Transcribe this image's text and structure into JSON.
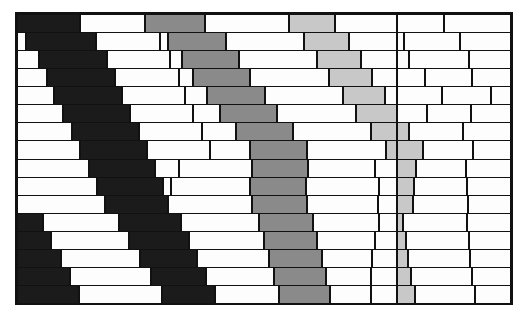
{
  "figure": {
    "name": "masonry-wall-diagram",
    "background_color": "#ffffff",
    "outline_color": "#111111"
  },
  "geometry": {
    "origin_x": 17,
    "origin_y": 14,
    "wall_width": 494,
    "wall_height": 289,
    "row_count": 16,
    "row_height": 18.0625,
    "mortar_line_width": 1.5,
    "outer_border_width": 2
  },
  "palette": {
    "white": "#fdfdfd",
    "black": "#1b1b1b",
    "dark_gray": "#8a8a8a",
    "light_gray": "#c8c8c8",
    "mortar": "#111111"
  },
  "legend": {
    "band_1_label": "black band",
    "band_1_color": "#1b1b1b",
    "band_2_label": "dark gray band",
    "band_2_color": "#8a8a8a",
    "band_3_label": "light gray band",
    "band_3_color": "#c8c8c8",
    "field_label": "plain brick",
    "field_color": "#fdfdfd"
  },
  "chart_data": {
    "type": "table",
    "xlabel": "",
    "ylabel": "",
    "rows": [
      {
        "index": 1,
        "bricks": [
          {
            "x": 0,
            "w": 63,
            "color": "black"
          },
          {
            "x": 63,
            "w": 65,
            "color": "white"
          },
          {
            "x": 128,
            "w": 60,
            "color": "dark"
          },
          {
            "x": 188,
            "w": 84,
            "color": "white"
          },
          {
            "x": 272,
            "w": 46,
            "color": "light"
          },
          {
            "x": 318,
            "w": 62,
            "color": "white"
          },
          {
            "x": 380,
            "w": 47,
            "color": "white"
          },
          {
            "x": 427,
            "w": 67,
            "color": "white"
          }
        ]
      },
      {
        "index": 2,
        "bricks": [
          {
            "x": 0,
            "w": 9,
            "color": "white"
          },
          {
            "x": 9,
            "w": 70,
            "color": "black"
          },
          {
            "x": 79,
            "w": 64,
            "color": "white"
          },
          {
            "x": 143,
            "w": 8,
            "color": "white"
          },
          {
            "x": 151,
            "w": 58,
            "color": "dark"
          },
          {
            "x": 209,
            "w": 78,
            "color": "white"
          },
          {
            "x": 287,
            "w": 45,
            "color": "light"
          },
          {
            "x": 332,
            "w": 48,
            "color": "white"
          },
          {
            "x": 380,
            "w": 7,
            "color": "white"
          },
          {
            "x": 387,
            "w": 56,
            "color": "white"
          },
          {
            "x": 443,
            "w": 51,
            "color": "white"
          }
        ]
      },
      {
        "index": 3,
        "bricks": [
          {
            "x": 0,
            "w": 22,
            "color": "white"
          },
          {
            "x": 22,
            "w": 68,
            "color": "black"
          },
          {
            "x": 90,
            "w": 63,
            "color": "white"
          },
          {
            "x": 153,
            "w": 12,
            "color": "white"
          },
          {
            "x": 165,
            "w": 57,
            "color": "dark"
          },
          {
            "x": 222,
            "w": 78,
            "color": "white"
          },
          {
            "x": 300,
            "w": 44,
            "color": "light"
          },
          {
            "x": 344,
            "w": 36,
            "color": "white"
          },
          {
            "x": 380,
            "w": 12,
            "color": "white"
          },
          {
            "x": 392,
            "w": 60,
            "color": "white"
          },
          {
            "x": 452,
            "w": 42,
            "color": "white"
          }
        ]
      },
      {
        "index": 4,
        "bricks": [
          {
            "x": 0,
            "w": 30,
            "color": "white"
          },
          {
            "x": 30,
            "w": 68,
            "color": "black"
          },
          {
            "x": 98,
            "w": 64,
            "color": "white"
          },
          {
            "x": 162,
            "w": 14,
            "color": "white"
          },
          {
            "x": 176,
            "w": 57,
            "color": "dark"
          },
          {
            "x": 233,
            "w": 79,
            "color": "white"
          },
          {
            "x": 312,
            "w": 43,
            "color": "light"
          },
          {
            "x": 355,
            "w": 25,
            "color": "white"
          },
          {
            "x": 380,
            "w": 28,
            "color": "white"
          },
          {
            "x": 408,
            "w": 47,
            "color": "white"
          },
          {
            "x": 455,
            "w": 39,
            "color": "white"
          }
        ]
      },
      {
        "index": 5,
        "bricks": [
          {
            "x": 0,
            "w": 37,
            "color": "white"
          },
          {
            "x": 37,
            "w": 68,
            "color": "black"
          },
          {
            "x": 105,
            "w": 63,
            "color": "white"
          },
          {
            "x": 168,
            "w": 22,
            "color": "white"
          },
          {
            "x": 190,
            "w": 58,
            "color": "dark"
          },
          {
            "x": 248,
            "w": 78,
            "color": "white"
          },
          {
            "x": 326,
            "w": 42,
            "color": "light"
          },
          {
            "x": 368,
            "w": 12,
            "color": "white"
          },
          {
            "x": 380,
            "w": 45,
            "color": "white"
          },
          {
            "x": 425,
            "w": 49,
            "color": "white"
          },
          {
            "x": 474,
            "w": 20,
            "color": "white"
          }
        ]
      },
      {
        "index": 6,
        "bricks": [
          {
            "x": 0,
            "w": 46,
            "color": "white"
          },
          {
            "x": 46,
            "w": 67,
            "color": "black"
          },
          {
            "x": 113,
            "w": 63,
            "color": "white"
          },
          {
            "x": 176,
            "w": 27,
            "color": "white"
          },
          {
            "x": 203,
            "w": 57,
            "color": "dark"
          },
          {
            "x": 260,
            "w": 79,
            "color": "white"
          },
          {
            "x": 339,
            "w": 41,
            "color": "light"
          },
          {
            "x": 380,
            "w": 30,
            "color": "white"
          },
          {
            "x": 410,
            "w": 44,
            "color": "white"
          },
          {
            "x": 454,
            "w": 40,
            "color": "white"
          }
        ]
      },
      {
        "index": 7,
        "bricks": [
          {
            "x": 0,
            "w": 55,
            "color": "white"
          },
          {
            "x": 55,
            "w": 67,
            "color": "black"
          },
          {
            "x": 122,
            "w": 63,
            "color": "white"
          },
          {
            "x": 185,
            "w": 34,
            "color": "white"
          },
          {
            "x": 219,
            "w": 57,
            "color": "dark"
          },
          {
            "x": 276,
            "w": 78,
            "color": "white"
          },
          {
            "x": 354,
            "w": 26,
            "color": "light"
          },
          {
            "x": 380,
            "w": 12,
            "color": "light"
          },
          {
            "x": 392,
            "w": 54,
            "color": "white"
          },
          {
            "x": 446,
            "w": 48,
            "color": "white"
          }
        ]
      },
      {
        "index": 8,
        "bricks": [
          {
            "x": 0,
            "w": 63,
            "color": "white"
          },
          {
            "x": 63,
            "w": 67,
            "color": "black"
          },
          {
            "x": 130,
            "w": 63,
            "color": "white"
          },
          {
            "x": 193,
            "w": 40,
            "color": "white"
          },
          {
            "x": 233,
            "w": 57,
            "color": "dark"
          },
          {
            "x": 290,
            "w": 79,
            "color": "white"
          },
          {
            "x": 369,
            "w": 11,
            "color": "light"
          },
          {
            "x": 380,
            "w": 26,
            "color": "light"
          },
          {
            "x": 406,
            "w": 50,
            "color": "white"
          },
          {
            "x": 456,
            "w": 38,
            "color": "white"
          }
        ]
      },
      {
        "index": 9,
        "bricks": [
          {
            "x": 0,
            "w": 72,
            "color": "white"
          },
          {
            "x": 72,
            "w": 66,
            "color": "black"
          },
          {
            "x": 138,
            "w": 24,
            "color": "white"
          },
          {
            "x": 162,
            "w": 73,
            "color": "white"
          },
          {
            "x": 235,
            "w": 56,
            "color": "dark"
          },
          {
            "x": 291,
            "w": 67,
            "color": "white"
          },
          {
            "x": 358,
            "w": 22,
            "color": "white"
          },
          {
            "x": 380,
            "w": 19,
            "color": "light"
          },
          {
            "x": 399,
            "w": 50,
            "color": "white"
          },
          {
            "x": 449,
            "w": 45,
            "color": "white"
          }
        ]
      },
      {
        "index": 10,
        "bricks": [
          {
            "x": 0,
            "w": 80,
            "color": "white"
          },
          {
            "x": 80,
            "w": 66,
            "color": "black"
          },
          {
            "x": 146,
            "w": 8,
            "color": "white"
          },
          {
            "x": 154,
            "w": 79,
            "color": "white"
          },
          {
            "x": 233,
            "w": 56,
            "color": "dark"
          },
          {
            "x": 289,
            "w": 73,
            "color": "white"
          },
          {
            "x": 362,
            "w": 18,
            "color": "white"
          },
          {
            "x": 380,
            "w": 17,
            "color": "light"
          },
          {
            "x": 397,
            "w": 53,
            "color": "white"
          },
          {
            "x": 450,
            "w": 44,
            "color": "white"
          }
        ]
      },
      {
        "index": 11,
        "bricks": [
          {
            "x": 0,
            "w": 88,
            "color": "white"
          },
          {
            "x": 88,
            "w": 63,
            "color": "black"
          },
          {
            "x": 151,
            "w": 84,
            "color": "white"
          },
          {
            "x": 235,
            "w": 55,
            "color": "dark"
          },
          {
            "x": 290,
            "w": 71,
            "color": "white"
          },
          {
            "x": 361,
            "w": 19,
            "color": "white"
          },
          {
            "x": 380,
            "w": 16,
            "color": "light"
          },
          {
            "x": 396,
            "w": 55,
            "color": "white"
          },
          {
            "x": 451,
            "w": 43,
            "color": "white"
          }
        ]
      },
      {
        "index": 12,
        "bricks": [
          {
            "x": 0,
            "w": 26,
            "color": "black"
          },
          {
            "x": 26,
            "w": 76,
            "color": "white"
          },
          {
            "x": 102,
            "w": 62,
            "color": "black"
          },
          {
            "x": 164,
            "w": 78,
            "color": "white"
          },
          {
            "x": 242,
            "w": 54,
            "color": "dark"
          },
          {
            "x": 296,
            "w": 66,
            "color": "white"
          },
          {
            "x": 362,
            "w": 18,
            "color": "white"
          },
          {
            "x": 380,
            "w": 6,
            "color": "light"
          },
          {
            "x": 386,
            "w": 64,
            "color": "white"
          },
          {
            "x": 450,
            "w": 44,
            "color": "white"
          }
        ]
      },
      {
        "index": 13,
        "bricks": [
          {
            "x": 0,
            "w": 34,
            "color": "black"
          },
          {
            "x": 34,
            "w": 78,
            "color": "white"
          },
          {
            "x": 112,
            "w": 60,
            "color": "black"
          },
          {
            "x": 172,
            "w": 75,
            "color": "white"
          },
          {
            "x": 247,
            "w": 53,
            "color": "dark"
          },
          {
            "x": 300,
            "w": 58,
            "color": "white"
          },
          {
            "x": 358,
            "w": 22,
            "color": "white"
          },
          {
            "x": 380,
            "w": 9,
            "color": "light"
          },
          {
            "x": 389,
            "w": 63,
            "color": "white"
          },
          {
            "x": 452,
            "w": 42,
            "color": "white"
          }
        ]
      },
      {
        "index": 14,
        "bricks": [
          {
            "x": 0,
            "w": 44,
            "color": "black"
          },
          {
            "x": 44,
            "w": 79,
            "color": "white"
          },
          {
            "x": 123,
            "w": 57,
            "color": "black"
          },
          {
            "x": 180,
            "w": 72,
            "color": "white"
          },
          {
            "x": 252,
            "w": 53,
            "color": "dark"
          },
          {
            "x": 305,
            "w": 50,
            "color": "white"
          },
          {
            "x": 355,
            "w": 25,
            "color": "white"
          },
          {
            "x": 380,
            "w": 11,
            "color": "light"
          },
          {
            "x": 391,
            "w": 62,
            "color": "white"
          },
          {
            "x": 453,
            "w": 41,
            "color": "white"
          }
        ]
      },
      {
        "index": 15,
        "bricks": [
          {
            "x": 0,
            "w": 53,
            "color": "black"
          },
          {
            "x": 53,
            "w": 81,
            "color": "white"
          },
          {
            "x": 134,
            "w": 55,
            "color": "black"
          },
          {
            "x": 189,
            "w": 68,
            "color": "white"
          },
          {
            "x": 257,
            "w": 52,
            "color": "dark"
          },
          {
            "x": 309,
            "w": 45,
            "color": "white"
          },
          {
            "x": 354,
            "w": 26,
            "color": "white"
          },
          {
            "x": 380,
            "w": 14,
            "color": "light"
          },
          {
            "x": 394,
            "w": 61,
            "color": "white"
          },
          {
            "x": 455,
            "w": 39,
            "color": "white"
          }
        ]
      },
      {
        "index": 16,
        "bricks": [
          {
            "x": 0,
            "w": 62,
            "color": "black"
          },
          {
            "x": 62,
            "w": 83,
            "color": "white"
          },
          {
            "x": 145,
            "w": 53,
            "color": "black"
          },
          {
            "x": 198,
            "w": 64,
            "color": "white"
          },
          {
            "x": 262,
            "w": 51,
            "color": "dark"
          },
          {
            "x": 313,
            "w": 41,
            "color": "white"
          },
          {
            "x": 354,
            "w": 26,
            "color": "white"
          },
          {
            "x": 380,
            "w": 18,
            "color": "light"
          },
          {
            "x": 398,
            "w": 60,
            "color": "white"
          },
          {
            "x": 458,
            "w": 36,
            "color": "white"
          }
        ]
      }
    ]
  }
}
